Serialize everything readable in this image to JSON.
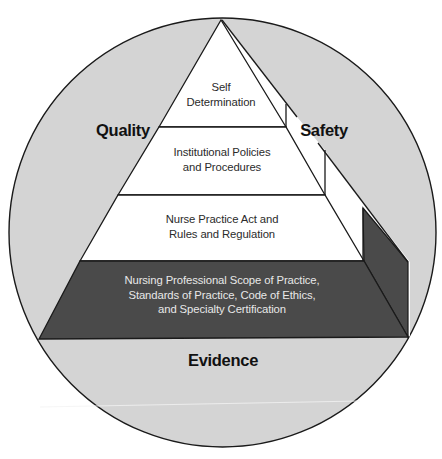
{
  "colors": {
    "circle_fill": "#d4d4d4",
    "outline": "#1a1a1a",
    "tier_fill": "#ffffff",
    "base_fill": "#4a4a4a",
    "base_text": "#e8e8e8",
    "label_text": "#111111"
  },
  "outer_labels": {
    "left": "Quality",
    "right": "Safety",
    "bottom": "Evidence"
  },
  "pyramid": {
    "tiers": [
      {
        "lines": [
          "Self",
          "Determination"
        ]
      },
      {
        "lines": [
          "Institutional Policies",
          "and Procedures"
        ]
      },
      {
        "lines": [
          "Nurse Practice Act and",
          "Rules and Regulation"
        ]
      },
      {
        "lines": [
          "Nursing Professional Scope of Practice,",
          "Standards of Practice, Code of Ethics,",
          "and Specialty Certification"
        ]
      }
    ]
  }
}
